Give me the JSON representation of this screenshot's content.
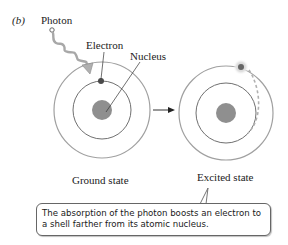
{
  "figure": {
    "panel_label": "(b)",
    "labels": {
      "photon": "Photon",
      "electron": "Electron",
      "nucleus": "Nucleus",
      "ground_state": "Ground state",
      "excited_state": "Excited state"
    },
    "callout": "The absorption of the photon boosts an electron to a shell farther from its atomic nucleus.",
    "colors": {
      "shell": "#9a9a9a",
      "nucleus": "#8f8f8f",
      "electron": "#555555",
      "excited_glow": "#d0d0d0",
      "photon_wave": "#a8a8a8",
      "text": "#222222"
    },
    "atoms": [
      {
        "state": "ground",
        "electron_shell": "inner"
      },
      {
        "state": "excited",
        "electron_shell": "outer"
      }
    ]
  }
}
